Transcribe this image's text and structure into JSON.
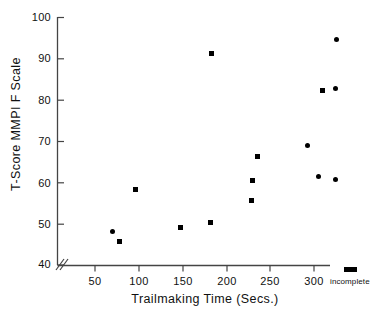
{
  "chart_data": {
    "type": "scatter",
    "title": "",
    "xlabel": "Trailmaking  Time (Secs.)",
    "ylabel": "T-Score MMPI F Scale",
    "xlim": [
      10,
      330
    ],
    "ylim": [
      40,
      100
    ],
    "xticks": [
      50,
      100,
      150,
      200,
      250,
      300
    ],
    "xtick_labels": [
      "50",
      "100",
      "150",
      "200",
      "250",
      "300"
    ],
    "yticks": [
      40,
      50,
      60,
      70,
      80,
      90,
      100
    ],
    "ytick_labels": [
      "40",
      "50",
      "60",
      "70",
      "80",
      "90",
      "100"
    ],
    "grid": false,
    "legend": "none",
    "axis_break": {
      "axis": "x",
      "note": "break slash between origin and first tick at 40 on y-axis"
    },
    "annotations": [
      {
        "text": "incomplete",
        "x": 330,
        "y": 40,
        "marker": "filled-bar"
      }
    ],
    "points": [
      {
        "x": 70,
        "y": 48.2,
        "marker": "circle",
        "incomplete": false
      },
      {
        "x": 78,
        "y": 45.8,
        "marker": "square",
        "incomplete": false
      },
      {
        "x": 96,
        "y": 58.2,
        "marker": "square",
        "incomplete": false
      },
      {
        "x": 148,
        "y": 49.0,
        "marker": "square",
        "incomplete": false
      },
      {
        "x": 182,
        "y": 50.3,
        "marker": "square",
        "incomplete": false
      },
      {
        "x": 183,
        "y": 91.1,
        "marker": "square",
        "incomplete": false
      },
      {
        "x": 229,
        "y": 55.5,
        "marker": "square",
        "incomplete": false
      },
      {
        "x": 230,
        "y": 60.4,
        "marker": "square",
        "incomplete": false
      },
      {
        "x": 235,
        "y": 66.3,
        "marker": "square",
        "incomplete": false
      },
      {
        "x": 293,
        "y": 69.0,
        "marker": "circle",
        "incomplete": false
      },
      {
        "x": 305,
        "y": 61.5,
        "marker": "circle",
        "incomplete": false
      },
      {
        "x": 310,
        "y": 82.3,
        "marker": "square",
        "incomplete": false
      },
      {
        "x": 326,
        "y": 94.5,
        "marker": "circle",
        "incomplete": true
      },
      {
        "x": 324,
        "y": 82.8,
        "marker": "circle",
        "incomplete": true
      },
      {
        "x": 324,
        "y": 60.6,
        "marker": "circle",
        "incomplete": true
      }
    ]
  },
  "axis": {
    "y_title": "T-Score MMPI F Scale",
    "x_title": "Trailmaking  Time (Secs.)",
    "incomplete_label": "incomplete"
  },
  "colors": {
    "marker": "#000000",
    "axis": "#333333",
    "background": "#ffffff",
    "text": "#111111"
  }
}
